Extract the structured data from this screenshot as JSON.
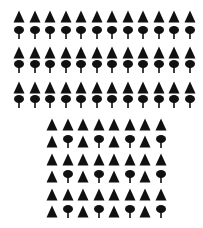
{
  "figure": {
    "colors": {
      "symbol": "#111111",
      "background": "#ffffff"
    },
    "symbols": {
      "T": "triangle-icon",
      "P": "tree-icon"
    },
    "top_grid": {
      "x0": 13,
      "dx": 15.5,
      "cols": 12,
      "rows": [
        {
          "y": 10,
          "pattern": "TTTTTTTTTTTT"
        },
        {
          "y": 26,
          "pattern": "PPPPPPPPPPPP"
        },
        {
          "y": 46,
          "pattern": "TTTTTTTTTTTT"
        },
        {
          "y": 60,
          "pattern": "PPPPPPPPPPPP"
        },
        {
          "y": 81,
          "pattern": "TTTTTTTTTTTT"
        },
        {
          "y": 95,
          "pattern": "PPPPPPPPPPPP"
        }
      ]
    },
    "bottom_grid": {
      "x0": 46,
      "dx": 15.5,
      "cols": 8,
      "rows": [
        {
          "y": 118,
          "pattern": "TTTTTTTT"
        },
        {
          "y": 135,
          "pattern": "TPTPTPTP"
        },
        {
          "y": 153,
          "pattern": "TTTTTTTT"
        },
        {
          "y": 170,
          "pattern": "TPTPTPTP"
        },
        {
          "y": 188,
          "pattern": "TTTTTTTT"
        },
        {
          "y": 205,
          "pattern": "TPTPTPTP"
        }
      ]
    }
  }
}
